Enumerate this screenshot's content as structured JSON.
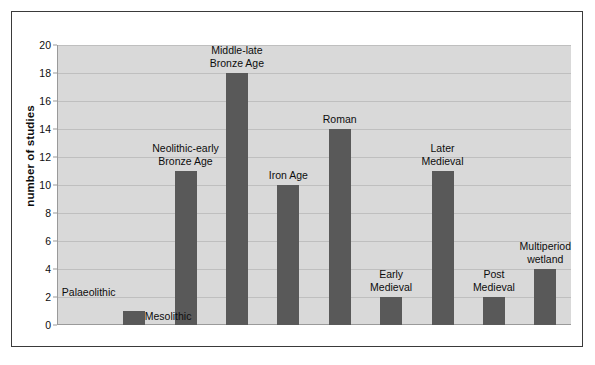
{
  "chart_data": {
    "type": "bar",
    "title": "",
    "subtitle": "",
    "xlabel": "",
    "ylabel": "number of studies",
    "ylim": [
      0,
      20
    ],
    "yticks": [
      0,
      2,
      4,
      6,
      8,
      10,
      12,
      14,
      16,
      18,
      20
    ],
    "ytick_labels": [
      "0",
      "2",
      "4",
      "6",
      "8",
      "10",
      "12",
      "14",
      "16",
      "18",
      "20"
    ],
    "grid": "horizontal",
    "legend": "none",
    "categories": [
      "Palaeolithic",
      "Mesolithic",
      "Neolithic-early\nBronze Age",
      "Middle-late\nBronze Age",
      "Iron Age",
      "Roman",
      "Early\nMedieval",
      "Later\nMedieval",
      "Post\nMedieval",
      "Multiperiod\nwetland"
    ],
    "values": [
      0,
      1,
      11,
      18,
      10,
      14,
      2,
      11,
      2,
      4
    ],
    "bar_color": "#595959",
    "plot_background": "#d9d9d9",
    "gridline_color": "#bfbfbf",
    "figure_background": "#ffffff",
    "frame_color": "#3a3a3a",
    "bars": [
      {
        "category": "Palaeolithic",
        "value": 0,
        "label": "Palaeolithic",
        "label_lines": [
          "Palaeolithic"
        ]
      },
      {
        "category": "Mesolithic",
        "value": 1,
        "label": "Mesolithic",
        "label_lines": [
          "Mesolithic"
        ]
      },
      {
        "category": "Neolithic-early Bronze Age",
        "value": 11,
        "label": "Neolithic-early Bronze Age",
        "label_lines": [
          "Neolithic-early",
          "Bronze Age"
        ]
      },
      {
        "category": "Middle-late Bronze Age",
        "value": 18,
        "label": "Middle-late Bronze Age",
        "label_lines": [
          "Middle-late",
          "Bronze Age"
        ]
      },
      {
        "category": "Iron Age",
        "value": 10,
        "label": "Iron Age",
        "label_lines": [
          "Iron Age"
        ]
      },
      {
        "category": "Roman",
        "value": 14,
        "label": "Roman",
        "label_lines": [
          "Roman"
        ]
      },
      {
        "category": "Early Medieval",
        "value": 2,
        "label": "Early Medieval",
        "label_lines": [
          "Early",
          "Medieval"
        ]
      },
      {
        "category": "Later Medieval",
        "value": 11,
        "label": "Later Medieval",
        "label_lines": [
          "Later",
          "Medieval"
        ]
      },
      {
        "category": "Post Medieval",
        "value": 2,
        "label": "Post Medieval",
        "label_lines": [
          "Post",
          "Medieval"
        ]
      },
      {
        "category": "Multiperiod wetland",
        "value": 4,
        "label": "Multiperiod wetland",
        "label_lines": [
          "Multiperiod",
          "wetland"
        ]
      }
    ]
  }
}
